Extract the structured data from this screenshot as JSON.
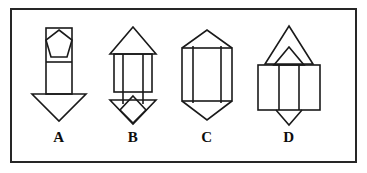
{
  "panel": {
    "border_color": "#262626",
    "background_color": "#ffffff",
    "stroke_color": "#1a1a1a"
  },
  "figures": [
    {
      "id": "A",
      "label": "A",
      "description": "Vertical rectangle containing a pentagon in its upper section, a horizontal divider below the pentagon, and a wide downward-pointing arrowhead triangle at the bottom.",
      "parts": [
        "rectangle",
        "pentagon",
        "horizontal-divider",
        "down-arrowhead"
      ]
    },
    {
      "id": "B",
      "label": "B",
      "description": "Upward-pointing triangle roof over a rectangle with two inner vertical lines, and a downward arrowhead containing a diamond at the bottom.",
      "parts": [
        "up-triangle",
        "rectangle",
        "two-vertical-lines",
        "down-arrowhead",
        "diamond"
      ]
    },
    {
      "id": "C",
      "label": "C",
      "description": "Elongated hexagon with a shallow triangular top and bottom and a rectangular body crossed by two inner vertical lines.",
      "parts": [
        "up-triangle-top",
        "rectangle",
        "two-vertical-lines",
        "down-triangle-bottom"
      ]
    },
    {
      "id": "D",
      "label": "D",
      "description": "Tall upward triangle with a smaller nested triangle at its base, above a wide rectangle split by two vertical lines, with a narrow downward triangle beneath.",
      "parts": [
        "large-up-triangle",
        "small-up-triangle",
        "wide-rectangle",
        "two-vertical-lines",
        "down-triangle"
      ]
    }
  ]
}
